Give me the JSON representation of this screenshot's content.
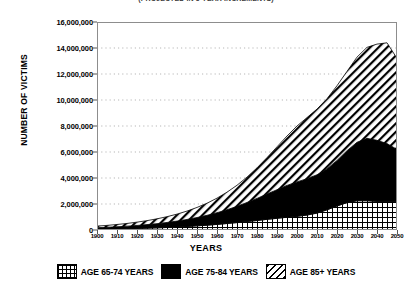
{
  "chart_title": "(PROJECTED IN 5-YEAR INCREMENTS)",
  "axes": {
    "ylabel": "NUMBER OF VICTIMS",
    "xlabel": "YEARS"
  },
  "legend": [
    {
      "label": "AGE 65-74 YEARS",
      "pattern": "grid"
    },
    {
      "label": "AGE 75-84 YEARS",
      "pattern": "solid-black"
    },
    {
      "label": "AGE 85+ YEARS",
      "pattern": "diagonal-hatch"
    }
  ],
  "chart_data": {
    "type": "area",
    "title": "(PROJECTED IN 5-YEAR INCREMENTS)",
    "xlabel": "YEARS",
    "ylabel": "NUMBER OF VICTIMS",
    "xlim": [
      1900,
      2050
    ],
    "ylim": [
      0,
      16000000
    ],
    "ytick_labels": [
      "0",
      "2,000,000",
      "4,000,000",
      "6,000,000",
      "8,000,000",
      "10,000,000",
      "12,000,000",
      "14,000,000",
      "16,000,000"
    ],
    "ytick_values": [
      0,
      2000000,
      4000000,
      6000000,
      8000000,
      10000000,
      12000000,
      14000000,
      16000000
    ],
    "xtick_labels": [
      "1900",
      "1910",
      "1920",
      "1930",
      "1940",
      "1950",
      "1960",
      "1970",
      "1980",
      "1990",
      "2000",
      "2010",
      "2020",
      "2030",
      "2040",
      "2050"
    ],
    "xtick_values": [
      1900,
      1910,
      1920,
      1930,
      1940,
      1950,
      1960,
      1970,
      1980,
      1990,
      2000,
      2010,
      2020,
      2030,
      2040,
      2050
    ],
    "grid": true,
    "grid_axis": "y",
    "legend_position": "below",
    "stacked": true,
    "x": [
      1900,
      1905,
      1910,
      1915,
      1920,
      1925,
      1930,
      1935,
      1940,
      1945,
      1950,
      1955,
      1960,
      1965,
      1970,
      1975,
      1980,
      1985,
      1990,
      1995,
      2000,
      2005,
      2010,
      2015,
      2020,
      2025,
      2030,
      2035,
      2040,
      2045,
      2050
    ],
    "series": [
      {
        "name": "AGE 65-74 YEARS",
        "pattern": "grid",
        "values": [
          60000,
          70000,
          85000,
          100000,
          120000,
          140000,
          165000,
          195000,
          230000,
          270000,
          320000,
          370000,
          430000,
          500000,
          570000,
          650000,
          730000,
          820000,
          900000,
          980000,
          1050000,
          1150000,
          1300000,
          1550000,
          1850000,
          2100000,
          2250000,
          2250000,
          2200000,
          2200000,
          2200000
        ]
      },
      {
        "name": "AGE 75-84 YEARS",
        "pattern": "solid-black",
        "values": [
          120000,
          140000,
          165000,
          195000,
          230000,
          275000,
          325000,
          385000,
          455000,
          540000,
          640000,
          760000,
          900000,
          1060000,
          1250000,
          1470000,
          1700000,
          1950000,
          2200000,
          2450000,
          2650000,
          2800000,
          2950000,
          3150000,
          3500000,
          4000000,
          4500000,
          4800000,
          4700000,
          4450000,
          4000000
        ]
      },
      {
        "name": "AGE 85+ YEARS",
        "pattern": "diagonal-hatch",
        "values": [
          120000,
          145000,
          175000,
          210000,
          255000,
          305000,
          370000,
          445000,
          535000,
          645000,
          775000,
          930000,
          1120000,
          1350000,
          1620000,
          1950000,
          2350000,
          2800000,
          3300000,
          3800000,
          4300000,
          4700000,
          5050000,
          5400000,
          5750000,
          6100000,
          6550000,
          7000000,
          7400000,
          7750000,
          7000000
        ]
      }
    ],
    "totals": [
      300000,
      355000,
      425000,
      505000,
      605000,
      720000,
      860000,
      1025000,
      1220000,
      1455000,
      1735000,
      2060000,
      2450000,
      2910000,
      3440000,
      4070000,
      4780000,
      5570000,
      6400000,
      7230000,
      8000000,
      8650000,
      9300000,
      10100000,
      11100000,
      12200000,
      13300000,
      14050000,
      14300000,
      14400000,
      13200000
    ]
  }
}
